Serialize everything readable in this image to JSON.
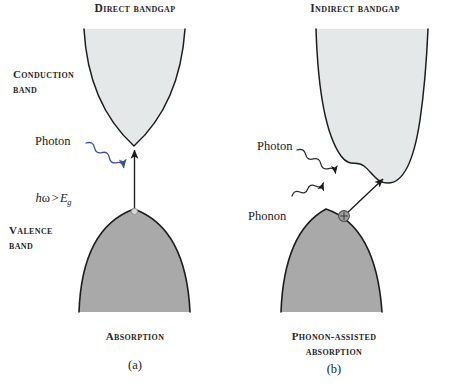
{
  "figure": {
    "kind": "physics-band-diagram",
    "background": "#ffffff",
    "colors": {
      "conduction_band_fill": "#e4e8e9",
      "valence_band_fill": "#a9a9a9",
      "band_outline": "#1d1d1d",
      "arrow": "#1b1b1b",
      "photon_wave_left": "#3b4f97",
      "text": "#26262a",
      "hole_marker": "#9b9b9b"
    }
  },
  "panel_a": {
    "heading": "Direct bandgap",
    "conduction_label_line1": "Conduction",
    "conduction_label_line2": "band",
    "valence_label_line1": "Valence",
    "valence_label_line2": "band",
    "photon_label": "Photon",
    "energy_condition": {
      "hbar": "h",
      "omega": "ω",
      "operator": ">",
      "energy_symbol": "E",
      "subscript": "g",
      "full": "hω > Eg"
    },
    "caption": "Absorption",
    "panel_id": "(a)",
    "transition": "vertical",
    "quasiparticles": [
      "photon"
    ],
    "hole_marker": "open-circle"
  },
  "panel_b": {
    "heading": "Indirect bandgap",
    "photon_label": "Photon",
    "phonon_label": "Phonon",
    "caption_line1": "Phonon-assisted",
    "caption_line2": "absorption",
    "panel_id": "(b)",
    "transition": "diagonal",
    "quasiparticles": [
      "photon",
      "phonon"
    ],
    "hole_marker": "circled-plus",
    "hole_marker_glyph": "+"
  }
}
